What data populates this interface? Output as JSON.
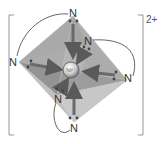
{
  "diagram": {
    "title": "",
    "complex_charge": "2+",
    "central_ion": "Ni²⁺",
    "ligand_atoms": [
      {
        "id": "n-top",
        "label": "N"
      },
      {
        "id": "n-upper-right",
        "label": "N"
      },
      {
        "id": "n-left",
        "label": "N"
      },
      {
        "id": "n-right",
        "label": "N"
      },
      {
        "id": "n-lower-left",
        "label": "N"
      },
      {
        "id": "n-bottom",
        "label": "N"
      }
    ],
    "geometry": "octahedral",
    "colors": {
      "octahedron_dark": "#8a8a8a",
      "octahedron_mid": "#b0b0b0",
      "octahedron_light": "#d8d8d8",
      "arrow": "#6e6e6e",
      "text": "#333333",
      "bracket": "#999999"
    }
  }
}
